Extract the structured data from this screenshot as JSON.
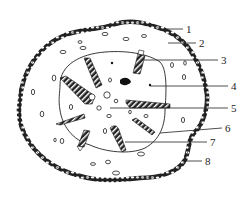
{
  "diagram": {
    "type": "cross-section",
    "labels": [
      {
        "id": "1",
        "text": "1",
        "x": 188,
        "y": 33,
        "lx1": 166,
        "ly1": 29,
        "lx2": 183,
        "ly2": 29
      },
      {
        "id": "2",
        "text": "2",
        "x": 200,
        "y": 47,
        "lx1": 168,
        "ly1": 43,
        "lx2": 196,
        "ly2": 43
      },
      {
        "id": "3",
        "text": "3",
        "x": 222,
        "y": 64,
        "lx1": 144,
        "ly1": 60,
        "lx2": 218,
        "ly2": 60
      },
      {
        "id": "4",
        "text": "4",
        "x": 232,
        "y": 90,
        "lx1": 150,
        "ly1": 86,
        "lx2": 228,
        "ly2": 86
      },
      {
        "id": "5",
        "text": "5",
        "x": 232,
        "y": 112,
        "lx1": 110,
        "ly1": 108,
        "lx2": 228,
        "ly2": 108
      },
      {
        "id": "6",
        "text": "6",
        "x": 226,
        "y": 132,
        "lx1": 160,
        "ly1": 133,
        "lx2": 222,
        "ly2": 128
      },
      {
        "id": "7",
        "text": "7",
        "x": 212,
        "y": 146,
        "lx1": 125,
        "ly1": 142,
        "lx2": 207,
        "ly2": 142
      },
      {
        "id": "8",
        "text": "8",
        "x": 206,
        "y": 165,
        "lx1": 186,
        "ly1": 161,
        "lx2": 202,
        "ly2": 161
      }
    ],
    "colors": {
      "stroke": "#222222",
      "fill_dark": "#1a1a1a",
      "background": "#ffffff"
    }
  }
}
